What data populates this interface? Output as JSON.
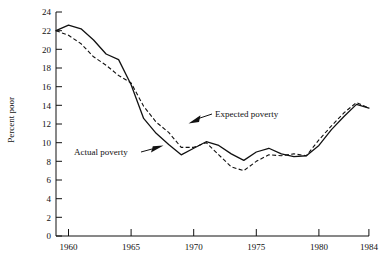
{
  "chart_data": {
    "type": "line",
    "title": "",
    "xlabel": "",
    "ylabel": "Percent poor",
    "xlim": [
      1959,
      1984
    ],
    "ylim": [
      0,
      24
    ],
    "xticks": [
      1960,
      1965,
      1970,
      1975,
      1980,
      1984
    ],
    "xtick_labels": [
      "1960",
      "1965",
      "1970",
      "1975",
      "1980",
      "1984"
    ],
    "yticks": [
      0,
      2,
      4,
      6,
      8,
      10,
      12,
      14,
      16,
      18,
      20,
      22,
      24
    ],
    "ytick_labels": [
      "0",
      "2",
      "4",
      "6",
      "8",
      "10",
      "12",
      "14",
      "16",
      "18",
      "20",
      "22",
      "24"
    ],
    "grid": false,
    "legend_position": "inline-annotations",
    "x": [
      1959,
      1960,
      1961,
      1962,
      1963,
      1964,
      1965,
      1966,
      1967,
      1968,
      1969,
      1970,
      1971,
      1972,
      1973,
      1974,
      1975,
      1976,
      1977,
      1978,
      1979,
      1980,
      1981,
      1982,
      1983,
      1984
    ],
    "series": [
      {
        "name": "Actual poverty",
        "style": "solid",
        "values": [
          22.0,
          22.6,
          22.2,
          21.0,
          19.5,
          18.9,
          16.2,
          12.6,
          11.0,
          9.8,
          8.7,
          9.4,
          10.1,
          9.7,
          8.8,
          8.1,
          9.0,
          9.4,
          8.8,
          8.5,
          8.6,
          9.7,
          11.4,
          12.8,
          14.1,
          13.7
        ],
        "color": "#111111"
      },
      {
        "name": "Expected poverty",
        "style": "dashed",
        "values": [
          22.0,
          21.5,
          20.6,
          19.2,
          18.3,
          17.2,
          16.4,
          13.9,
          12.2,
          11.1,
          9.5,
          9.5,
          10.0,
          8.7,
          7.4,
          7.0,
          8.0,
          8.7,
          8.6,
          8.8,
          8.6,
          10.3,
          11.8,
          13.2,
          14.3,
          13.7
        ],
        "color": "#111111"
      }
    ],
    "annotations": [
      {
        "text": "Expected poverty",
        "x": 1970.7,
        "y": 12.6,
        "arrow_to_x": 1968.5,
        "arrow_to_y": 11.2
      },
      {
        "text": "Actual poverty",
        "x": 1962.1,
        "y": 9.4,
        "arrow_to_x": 1968.3,
        "arrow_to_y": 9.2
      }
    ]
  }
}
